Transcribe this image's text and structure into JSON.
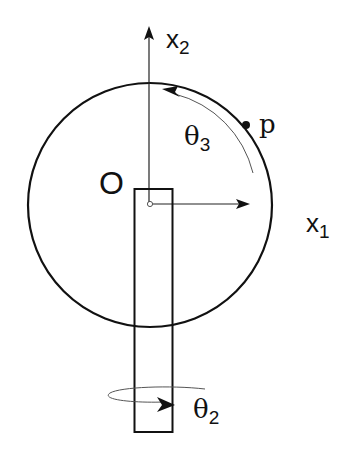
{
  "labels": {
    "origin": "O",
    "x1_main": "x",
    "x1_sub": "1",
    "x2_main": "x",
    "x2_sub": "2",
    "theta3_main": "θ",
    "theta3_sub": "3",
    "theta2_main": "θ",
    "theta2_sub": "2",
    "point": "p"
  },
  "colors": {
    "stroke": "#111111",
    "thin_stroke": "#555555",
    "background": "#ffffff"
  }
}
